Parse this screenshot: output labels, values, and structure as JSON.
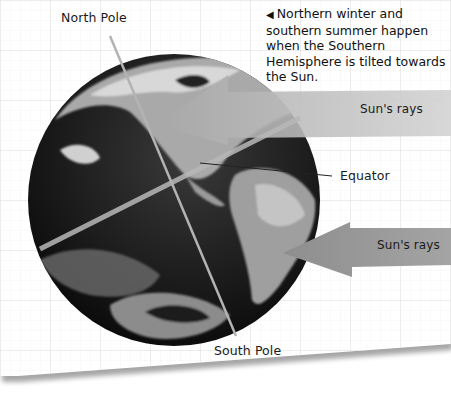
{
  "diagram": {
    "caption": {
      "marker": "◀",
      "text": "Northern winter and southern summer happen when the Southern Hemisphere is tilted towards the Sun."
    },
    "labels": {
      "north_pole": "North Pole",
      "south_pole": "South Pole",
      "equator": "Equator",
      "sun_rays_top": "Sun's rays",
      "sun_rays_bottom": "Sun's rays"
    },
    "colors": {
      "paper": "#ffffff",
      "grid": "#e6e6e6",
      "arrow": "#9a9a9a",
      "arrow_light": "#c8c8c8",
      "axis_line": "#b0b0b0",
      "globe_dark": "#1a1a1a",
      "text": "#111111"
    }
  }
}
